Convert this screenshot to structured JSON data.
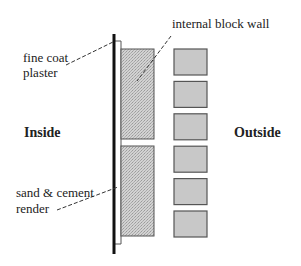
{
  "labels": {
    "plaster_line1": "fine coat",
    "plaster_line2": "plaster",
    "block_wall": "internal block wall",
    "render_line1": "sand & cement",
    "render_line2": "render",
    "inside": "Inside",
    "outside": "Outside"
  },
  "colors": {
    "block_fill": "#c8c8c8",
    "block_stroke": "#555555",
    "inner_block_fill": "#d0d0d0",
    "wall_line": "#111111"
  },
  "outer_block_count": 6,
  "inner_block_count": 2
}
